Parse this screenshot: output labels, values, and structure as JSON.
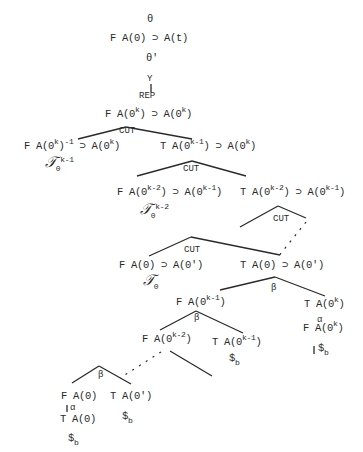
{
  "tree": {
    "top": {
      "theta": "θ",
      "root_formula": "F A(0) ⊃ A(t)",
      "theta_prime": "θ'",
      "y": "Y",
      "rep": "REP"
    },
    "level1": {
      "formula_a": "F A(0",
      "formula_a_sup": "k",
      "formula_a_end": ") ⊃ A(0",
      "formula_a_sup2": "k",
      "formula_a_end2": ")",
      "rule": "CUT"
    },
    "level2_left": {
      "pre": "F A(0",
      "sup1": "k",
      "mid": ")",
      "sup2": "-1",
      "mid2": " ⊃ A(0",
      "sup3": "k",
      "end": ")",
      "tau": "𝒯",
      "tau_sub": "0",
      "tau_sup": "k-1"
    },
    "level2_right": {
      "pre": "T A(0",
      "sup1": "k-1",
      "mid": ") ⊃ A(0",
      "sup2": "k",
      "end": ")",
      "rule": "CUT"
    },
    "level3_left": {
      "pre": "F A(0",
      "sup1": "k-2",
      "mid": ") ⊃ A(0",
      "sup2": "k-1",
      "end": ")",
      "tau": "𝒯",
      "tau_sub": "0",
      "tau_sup": "k-2"
    },
    "level3_right": {
      "pre": "T A(0",
      "sup1": "k-2",
      "mid": ") ⊃ A(0",
      "sup2": "k-1",
      "end": ")",
      "rule": "CUT"
    },
    "level4": {
      "rule": "CUT",
      "left": "F A(0) ⊃ A(0')",
      "left_tau": "𝒯",
      "left_tau_sub": "0",
      "right": "T A(0) ⊃ A(0')",
      "right_rule": "β"
    },
    "level5": {
      "left_pre": "F A(0",
      "left_sup": "k-1",
      "left_end": ")",
      "left_rule": "β",
      "right_pre": "T A(0",
      "right_sup": "k",
      "right_end": ")",
      "right_alpha": "α",
      "right_child_pre": "F A(0",
      "right_child_sup": "k",
      "right_child_end": ")",
      "right_closed": "$",
      "right_closed_sub": "b"
    },
    "level6": {
      "left_pre": "F A(0",
      "left_sup": "k-2",
      "left_end": ")",
      "right_pre": "T A(0",
      "right_sup": "k-1",
      "right_end": ")",
      "right_closed": "$",
      "right_closed_sub": "b"
    },
    "level7": {
      "rule": "β",
      "left": "F A(0)",
      "left_alpha": "α",
      "left_child": "T A(0)",
      "left_closed": "$",
      "left_closed_sub": "b",
      "right": "T A(0')",
      "right_closed": "$",
      "right_closed_sub": "b"
    }
  }
}
